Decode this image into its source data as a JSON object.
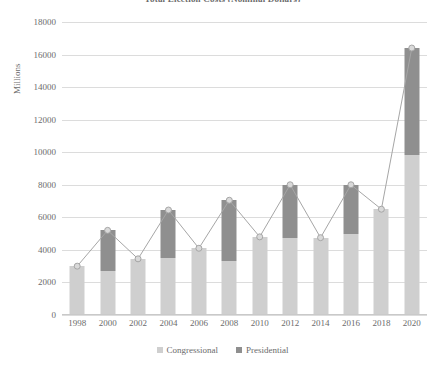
{
  "chart_data": {
    "type": "bar",
    "title": "Total Election Costs (Nominal Dollars)",
    "xlabel": "",
    "ylabel": "Millions",
    "ylim": [
      0,
      18000
    ],
    "ytick_step": 2000,
    "yticks": [
      "0",
      "2000",
      "4000",
      "6000",
      "8000",
      "10000",
      "12000",
      "14000",
      "16000",
      "18000"
    ],
    "grid": true,
    "legend_position": "bottom",
    "stacked": true,
    "categories": [
      "1998",
      "2000",
      "2002",
      "2004",
      "2006",
      "2008",
      "2010",
      "2012",
      "2014",
      "2016",
      "2018",
      "2020"
    ],
    "series": [
      {
        "name": "Congressional",
        "color": "#cfcfcf",
        "values": [
          3000,
          2700,
          3450,
          3500,
          4100,
          3300,
          4800,
          4750,
          4750,
          5000,
          6500,
          9800
        ]
      },
      {
        "name": "Presidential",
        "color": "#8f8f8f",
        "values": [
          0,
          2500,
          0,
          2950,
          0,
          3750,
          0,
          3250,
          0,
          3000,
          0,
          6600
        ]
      }
    ],
    "totals": {
      "name": "Total",
      "color": "#a6a6a6",
      "values": [
        3000,
        5200,
        3450,
        6450,
        4100,
        7050,
        4800,
        8000,
        4750,
        8000,
        6500,
        16400
      ]
    },
    "line_overlay": {
      "name": "Total",
      "marker": "circle",
      "color": "#a6a6a6",
      "values": [
        3000,
        5200,
        3450,
        6450,
        4100,
        7050,
        4800,
        8000,
        4750,
        8000,
        6500,
        16400
      ]
    }
  },
  "legend": {
    "items": [
      {
        "label": "Congressional",
        "color": "#cfcfcf"
      },
      {
        "label": "Presidential",
        "color": "#8f8f8f"
      }
    ]
  }
}
